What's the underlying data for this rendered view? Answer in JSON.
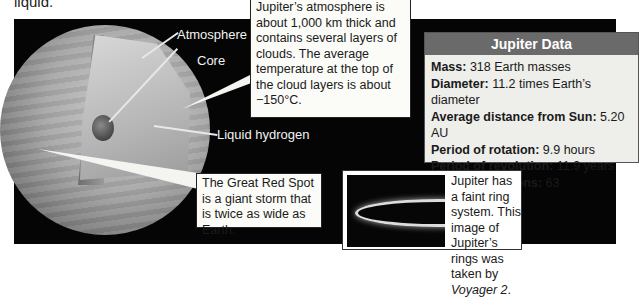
{
  "intro_fragment": "liquid.",
  "diagram": {
    "labels": {
      "atmosphere": "Atmosphere",
      "core": "Core",
      "liquid_hydrogen": "Liquid hydrogen"
    }
  },
  "callouts": {
    "atmosphere_note": "Jupiter’s atmosphere is about 1,000 km thick and contains several layers of clouds. The average temperature at the top of the cloud layers is about −150°C.",
    "red_spot_note": "The Great Red Spot is a giant storm that is twice as wide as Earth.",
    "rings_note_prefix": "Jupiter has a faint ring system. This image of Jupiter’s rings was taken by ",
    "rings_note_italic": "Voyager 2",
    "rings_note_suffix": "."
  },
  "data_box": {
    "title": "Jupiter Data",
    "rows": [
      {
        "label": "Mass:",
        "value": " 318 Earth masses"
      },
      {
        "label": "Diameter:",
        "value": " 11.2 times Earth’s diameter"
      },
      {
        "label": "Average distance from Sun:",
        "value": " 5.20 AU"
      },
      {
        "label": "Period of rotation:",
        "value": " 9.9 hours"
      },
      {
        "label": "Period of revolution:",
        "value": " 11.9 years"
      },
      {
        "label": "Number of moons:",
        "value": " 63"
      }
    ]
  },
  "colors": {
    "background": "#050505",
    "data_title_bg": "#6a6a6a",
    "data_body_bg": "#eeeeea"
  }
}
